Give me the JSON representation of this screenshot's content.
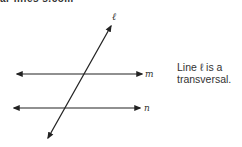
{
  "top_text": "ar lines s.com",
  "diagram": {
    "labels": {
      "transversal": "ℓ",
      "line1": "m",
      "line2": "n"
    },
    "colors": {
      "line": "#222222",
      "text": "#333333"
    }
  },
  "caption": {
    "line1": "Line ℓ is a",
    "line2": "transversal."
  }
}
